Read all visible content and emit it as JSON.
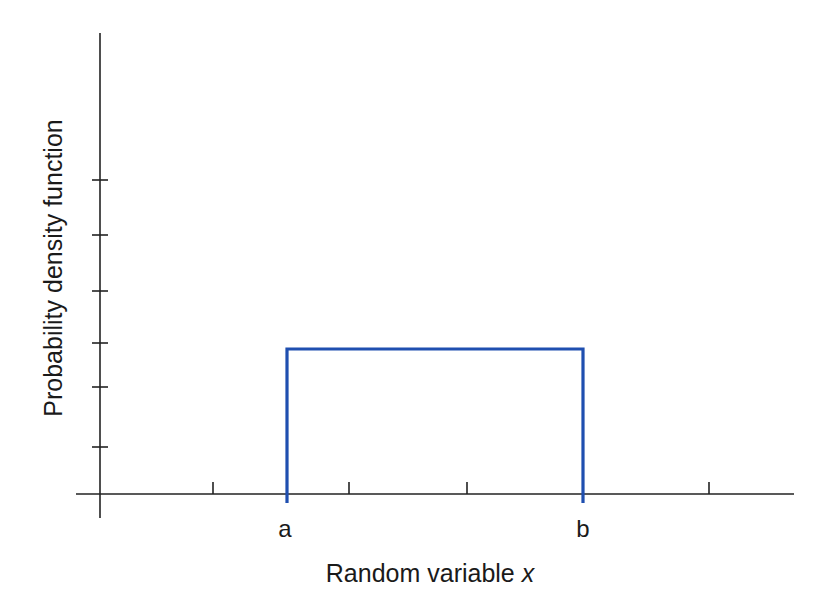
{
  "chart_data": {
    "type": "line",
    "title": "",
    "xlabel": "Random variable",
    "xlabel_var": "x",
    "ylabel": "Probability density function",
    "grid": false,
    "legend": null,
    "x_tick_labels": [
      "a",
      "b"
    ],
    "x_tick_marks_unlabeled": 4,
    "y_tick_marks_unlabeled": 6,
    "series": [
      {
        "name": "Uniform distribution PDF",
        "color": "#1f4fb0",
        "shape": "rectangle",
        "x": [
          "a",
          "a",
          "b",
          "b"
        ],
        "y": [
          0,
          0.4,
          0.4,
          0
        ],
        "description": "Constant density 1/(b-a) between a and b, zero elsewhere"
      }
    ]
  },
  "colors": {
    "axis": "#222222",
    "curve": "#1f4fb0",
    "text": "#1a1a1a"
  },
  "labels": {
    "a": "a",
    "b": "b",
    "xlabel_text": "Random variable ",
    "xlabel_var": "x",
    "ylabel": "Probability density function"
  },
  "geometry": {
    "origin": {
      "x": 100,
      "y": 494
    },
    "y_axis": {
      "x": 100,
      "top": 33,
      "bottom": 518
    },
    "x_axis": {
      "y": 494,
      "left": 76,
      "right": 794
    },
    "y_ticks": [
      180,
      235,
      291,
      343,
      387,
      447
    ],
    "x_ticks": [
      213,
      349,
      467,
      709
    ],
    "pdf": {
      "left": 287,
      "right": 583,
      "top": 349,
      "bottom": 503
    }
  }
}
